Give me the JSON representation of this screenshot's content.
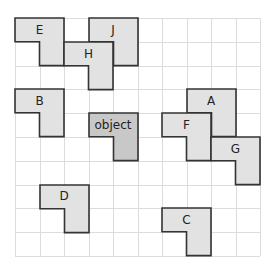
{
  "grid": {
    "cols": 10,
    "rows": 10,
    "cell_w": 24.5,
    "cell_h": 23.8,
    "line_color": "#dcdcdc"
  },
  "colors": {
    "shape_fill": "#e2e2e2",
    "object_fill": "#c8c8c8",
    "stroke": "#333333"
  },
  "shapes": [
    {
      "id": "E",
      "label": "E",
      "col": 0,
      "row": 0,
      "variant": "standard"
    },
    {
      "id": "J",
      "label": "J",
      "col": 3,
      "row": 0,
      "variant": "standard"
    },
    {
      "id": "H",
      "label": "H",
      "col": 2,
      "row": 1,
      "variant": "standard"
    },
    {
      "id": "B",
      "label": "B",
      "col": 0,
      "row": 3,
      "variant": "standard"
    },
    {
      "id": "object",
      "label": "object",
      "col": 3,
      "row": 4,
      "variant": "object"
    },
    {
      "id": "A",
      "label": "A",
      "col": 7,
      "row": 3,
      "variant": "standard"
    },
    {
      "id": "F",
      "label": "F",
      "col": 6,
      "row": 4,
      "variant": "standard"
    },
    {
      "id": "G",
      "label": "G",
      "col": 8,
      "row": 5,
      "variant": "standard"
    },
    {
      "id": "D",
      "label": "D",
      "col": 1,
      "row": 7,
      "variant": "standard"
    },
    {
      "id": "C",
      "label": "C",
      "col": 6,
      "row": 8,
      "variant": "standard"
    }
  ]
}
